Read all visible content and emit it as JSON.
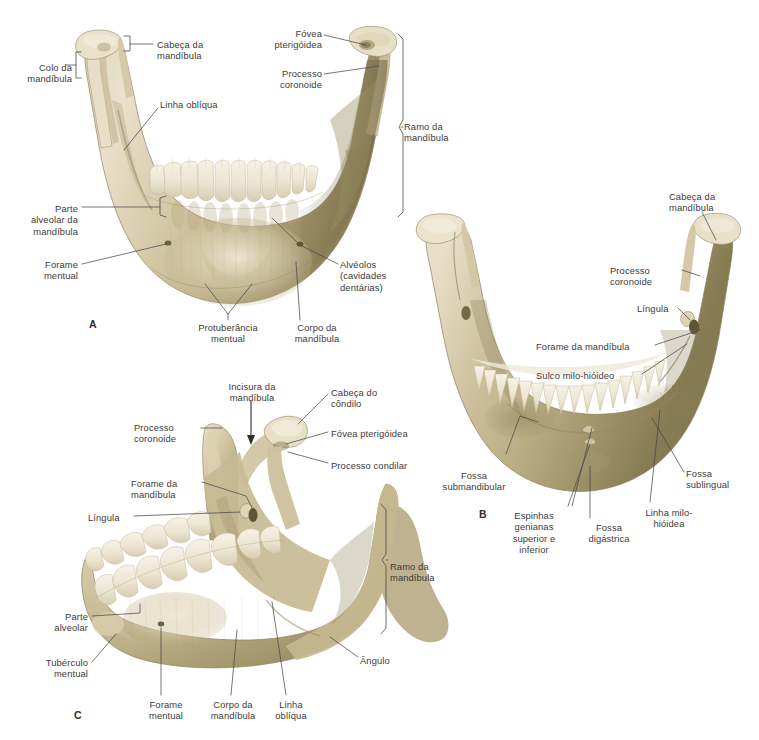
{
  "figure": {
    "kind": "anatomical-illustration",
    "subject": "Mandíbula",
    "language": "pt-BR",
    "background_color": "#ffffff",
    "bone_colors": {
      "highlight": "#ece4d2",
      "mid": "#cfc2a2",
      "shadow": "#9b8f66",
      "deep_shadow": "#776b47",
      "tooth": "#f3eee0",
      "outline": "#8d8261"
    },
    "label_color": "#3c3b39",
    "leader_color": "#4a4a48"
  },
  "panels": [
    {
      "id": "A",
      "letter": "A",
      "letter_pos": {
        "x": 89,
        "y": 318
      },
      "view": "anterior",
      "labels": [
        {
          "name": "colo-da-mandibula",
          "text": "Colo da\nmandíbula",
          "x": 6,
          "y": 62,
          "align": "r",
          "w": 66
        },
        {
          "name": "cabeca-da-mandibula",
          "text": "Cabeça da\nmandíbula",
          "x": 157,
          "y": 39,
          "align": "l",
          "w": 70
        },
        {
          "name": "fovea-pterigoidea",
          "text": "Fóvea\npterigóidea",
          "x": 254,
          "y": 28,
          "align": "r",
          "w": 68
        },
        {
          "name": "processo-coronoide",
          "text": "Processo\ncoronoide",
          "x": 256,
          "y": 68,
          "align": "r",
          "w": 66
        },
        {
          "name": "ramo-da-mandibula",
          "text": "Ramo da\nmandíbula",
          "x": 404,
          "y": 121,
          "align": "l",
          "w": 70
        },
        {
          "name": "linha-obliqua",
          "text": "Linha oblíqua",
          "x": 160,
          "y": 99,
          "align": "l",
          "w": 78
        },
        {
          "name": "parte-alveolar-da-mandibula",
          "text": "Parte\nalveolar da\nmandíbula",
          "x": 6,
          "y": 203,
          "align": "r",
          "w": 72
        },
        {
          "name": "forame-mentual",
          "text": "Forame\nmentual",
          "x": 6,
          "y": 259,
          "align": "r",
          "w": 72
        },
        {
          "name": "alveolos-cavidades-dentarias",
          "text": "Alvéolos\n(cavidades\ndentárias)",
          "x": 340,
          "y": 259,
          "align": "l",
          "w": 78
        },
        {
          "name": "protuberancia-mentual",
          "text": "Protuberância\nmentual",
          "x": 183,
          "y": 322,
          "align": "c",
          "w": 90
        },
        {
          "name": "corpo-da-mandibula",
          "text": "Corpo da\nmandíbula",
          "x": 282,
          "y": 322,
          "align": "c",
          "w": 70
        }
      ]
    },
    {
      "id": "B",
      "letter": "B",
      "letter_pos": {
        "x": 479,
        "y": 508
      },
      "view": "posterior",
      "labels": [
        {
          "name": "cabeca-da-mandibula",
          "text": "Cabeça da\nmandíbula",
          "x": 669,
          "y": 191,
          "align": "l",
          "w": 72
        },
        {
          "name": "processo-coronoide",
          "text": "Processo\ncoronoide",
          "x": 610,
          "y": 265,
          "align": "l",
          "w": 68
        },
        {
          "name": "lingula",
          "text": "Língula",
          "x": 637,
          "y": 303,
          "align": "l",
          "w": 46
        },
        {
          "name": "forame-da-mandibula",
          "text": "Forame da mandíbula",
          "x": 536,
          "y": 341,
          "align": "l",
          "w": 116
        },
        {
          "name": "sulco-milo-hioideo",
          "text": "Sulco milo-hióideo",
          "x": 536,
          "y": 370,
          "align": "l",
          "w": 102
        },
        {
          "name": "fossa-submandibular",
          "text": "Fossa\nsubmandibular",
          "x": 430,
          "y": 470,
          "align": "c",
          "w": 88
        },
        {
          "name": "fossa-sublingual",
          "text": "Fossa\nsublingual",
          "x": 686,
          "y": 468,
          "align": "l",
          "w": 64
        },
        {
          "name": "espinhas-genianas",
          "text": "Espinhas\ngenianas\nsuperior e\ninferior",
          "x": 495,
          "y": 510,
          "align": "c",
          "w": 78
        },
        {
          "name": "fossa-digastrica",
          "text": "Fossa\ndigástrica",
          "x": 578,
          "y": 522,
          "align": "c",
          "w": 62
        },
        {
          "name": "linha-milo-hioidea",
          "text": "Linha milo-\nhióidea",
          "x": 634,
          "y": 507,
          "align": "c",
          "w": 70
        }
      ]
    },
    {
      "id": "C",
      "letter": "C",
      "letter_pos": {
        "x": 74,
        "y": 709
      },
      "view": "oblique-left-lateral",
      "labels": [
        {
          "name": "incisura-da-mandibula",
          "text": "Incisura da\nmandíbula",
          "x": 215,
          "y": 381,
          "align": "c",
          "w": 74
        },
        {
          "name": "cabeca-do-condilo",
          "text": "Cabeça do\ncôndilo",
          "x": 331,
          "y": 387,
          "align": "l",
          "w": 66
        },
        {
          "name": "processo-coronoide",
          "text": "Processo\ncoronoide",
          "x": 134,
          "y": 422,
          "align": "l",
          "w": 66
        },
        {
          "name": "fovea-pterigoidea",
          "text": "Fóvea pterigóidea",
          "x": 331,
          "y": 428,
          "align": "l",
          "w": 100
        },
        {
          "name": "processo-condilar",
          "text": "Processo condilar",
          "x": 331,
          "y": 460,
          "align": "l",
          "w": 98
        },
        {
          "name": "forame-da-mandibula",
          "text": "Forame da\nmandíbula",
          "x": 131,
          "y": 478,
          "align": "l",
          "w": 68
        },
        {
          "name": "lingula",
          "text": "Língula",
          "x": 88,
          "y": 512,
          "align": "l",
          "w": 46
        },
        {
          "name": "ramo-da-mandibula",
          "text": "Ramo da\nmandíbula",
          "x": 390,
          "y": 561,
          "align": "l",
          "w": 70
        },
        {
          "name": "parte-alveolar",
          "text": "Parte\nalveolar",
          "x": 28,
          "y": 611,
          "align": "r",
          "w": 60
        },
        {
          "name": "tuberculo-mentual",
          "text": "Tubérculo\nmentual",
          "x": 20,
          "y": 657,
          "align": "r",
          "w": 68
        },
        {
          "name": "angulo",
          "text": "Ângulo",
          "x": 360,
          "y": 655,
          "align": "l",
          "w": 46
        },
        {
          "name": "forame-mentual",
          "text": "Forame\nmentual",
          "x": 137,
          "y": 699,
          "align": "c",
          "w": 58
        },
        {
          "name": "corpo-da-mandibula",
          "text": "Corpo da\nmandíbula",
          "x": 200,
          "y": 699,
          "align": "c",
          "w": 66
        },
        {
          "name": "linha-obliqua",
          "text": "Linha\noblíqua",
          "x": 266,
          "y": 699,
          "align": "c",
          "w": 50
        }
      ]
    }
  ]
}
